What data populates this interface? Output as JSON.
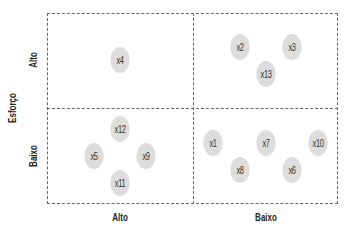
{
  "diagram": {
    "type": "2x2 matrix",
    "y_axis": {
      "title": "Esforço",
      "labels": [
        {
          "text": "Alto",
          "x": 33,
          "y": 60
        },
        {
          "text": "Baixo",
          "x": 33,
          "y": 156
        }
      ],
      "title_pos": {
        "x": 12,
        "y": 108
      }
    },
    "x_axis": {
      "labels": [
        {
          "text": "Alto",
          "x": 120,
          "y": 217
        },
        {
          "text": "Baixo",
          "x": 266,
          "y": 217
        }
      ]
    },
    "quadrants": [
      {
        "name": "alto-esforco-alto",
        "items": [
          "x4"
        ]
      },
      {
        "name": "alto-esforco-baixo",
        "items": [
          "x2",
          "x3",
          "x13"
        ]
      },
      {
        "name": "baixo-esforco-alto",
        "items": [
          "x12",
          "x5",
          "x9",
          "x11"
        ]
      },
      {
        "name": "baixo-esforco-baixo",
        "items": [
          "x1",
          "x7",
          "x10",
          "x8",
          "x6"
        ]
      }
    ],
    "items": [
      {
        "label": "x4",
        "x": 120,
        "y": 60
      },
      {
        "label": "x2",
        "x": 240,
        "y": 47
      },
      {
        "label": "x3",
        "x": 292,
        "y": 47
      },
      {
        "label": "x13",
        "x": 266,
        "y": 74
      },
      {
        "label": "x12",
        "x": 120,
        "y": 129
      },
      {
        "label": "x5",
        "x": 94,
        "y": 156
      },
      {
        "label": "x9",
        "x": 146,
        "y": 156
      },
      {
        "label": "x11",
        "x": 120,
        "y": 183
      },
      {
        "label": "x1",
        "x": 213,
        "y": 143
      },
      {
        "label": "x7",
        "x": 266,
        "y": 143
      },
      {
        "label": "x10",
        "x": 318,
        "y": 143
      },
      {
        "label": "x8",
        "x": 240,
        "y": 170
      },
      {
        "label": "x6",
        "x": 292,
        "y": 170
      }
    ],
    "colors": {
      "circle_fill": "#dddddd",
      "frame_line": "#666666",
      "text": "#222222"
    }
  }
}
